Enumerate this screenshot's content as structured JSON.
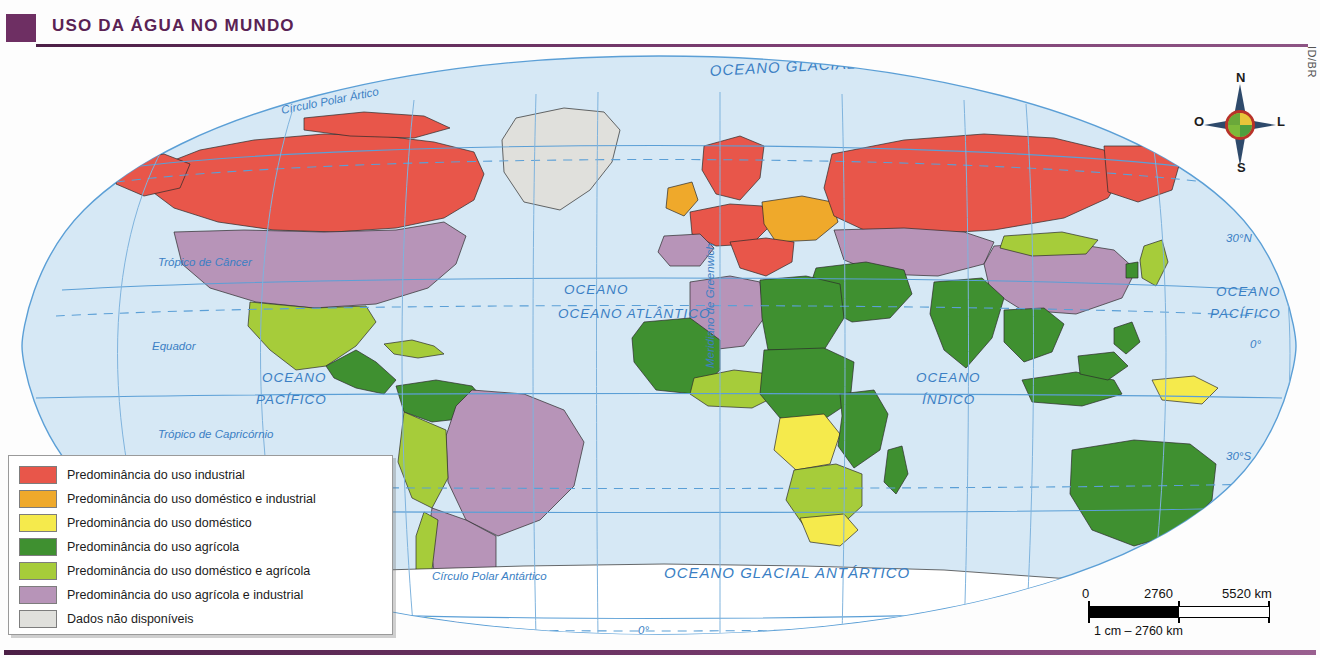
{
  "header": {
    "title": "USO DA ÁGUA NO MUNDO",
    "credit": "ID/BR"
  },
  "legend": {
    "items": [
      {
        "color": "#e8564a",
        "label": "Predominância do uso industrial"
      },
      {
        "color": "#efa92b",
        "label": "Predominância do uso doméstico e industrial"
      },
      {
        "color": "#f5ea4c",
        "label": "Predominância do uso doméstico"
      },
      {
        "color": "#3f9030",
        "label": "Predominância do uso agrícola"
      },
      {
        "color": "#a6cc3a",
        "label": "Predominância do uso doméstico e agrícola"
      },
      {
        "color": "#b794b8",
        "label": "Predominância do uso agrícola e industrial"
      },
      {
        "color": "#e0e0dc",
        "label": "Dados não disponíveis"
      }
    ]
  },
  "compass": {
    "north": "N",
    "south": "S",
    "east": "L",
    "west": "O"
  },
  "scale": {
    "zero": "0",
    "mid": "2760",
    "max": "5520 km",
    "caption": "1 cm – 2760 km"
  },
  "map": {
    "ocean_labels": [
      "OCEANO GLACIAL ÁRTICO",
      "OCEANO ATLÂNTICO",
      "OCEANO PACÍFICO",
      "OCEANO PACÍFICO",
      "OCEANO ÍNDICO",
      "OCEANO GLACIAL ANTÁRTICO"
    ],
    "labels": {
      "arctic_ocean": "OCEANO GLACIAL ÁRTICO",
      "atlantic": "OCEANO ATLÂNTICO",
      "pacific_west_line1": "OCEANO",
      "pacific_west_line2": "PACÍFICO",
      "pacific_east_line1": "OCEANO",
      "pacific_east_line2": "PACÍFICO",
      "indian_line1": "OCEANO",
      "indian_line2": "ÍNDICO",
      "antarctic_ocean": "OCEANO GLACIAL ANTÁRTICO",
      "arctic_circle": "Círculo Polar Ártico",
      "antarctic_circle": "Círculo Polar Antártico",
      "tropic_cancer": "Trópico de Câncer",
      "equator": "Equador",
      "tropic_capricorn": "Trópico de Capricórnio",
      "greenwich": "Meridiano de Greenwich"
    },
    "latitude_labels": [
      {
        "text": "60°N"
      },
      {
        "text": "30°N"
      },
      {
        "text": "0°"
      },
      {
        "text": "30°S"
      },
      {
        "text": "60°S"
      }
    ],
    "longitude_labels": [
      {
        "text": "120°O"
      },
      {
        "text": "60°O"
      },
      {
        "text": "0°"
      },
      {
        "text": "60°L"
      },
      {
        "text": "120°L"
      }
    ],
    "colors": {
      "ocean": "#d6e8f5",
      "graticule": "#5b9fd6",
      "label_blue": "#3b7fc4",
      "antarctica": "#ffffff",
      "border": "#2b2b2b"
    }
  }
}
